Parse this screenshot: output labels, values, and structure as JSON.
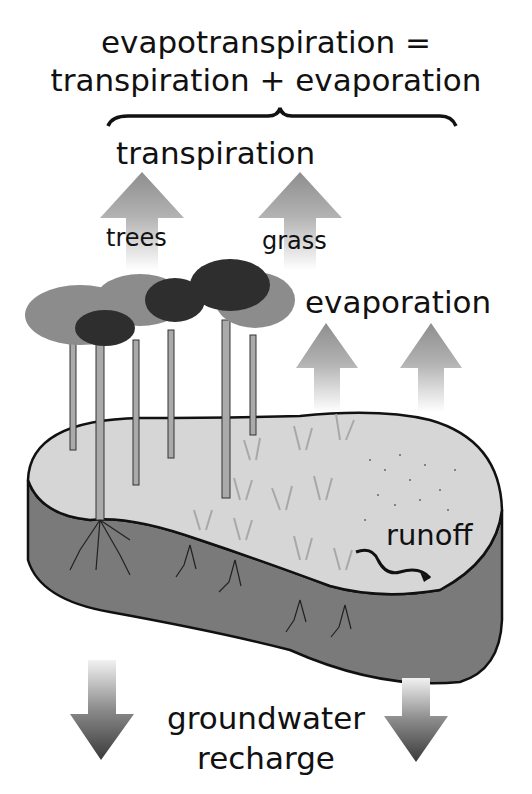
{
  "diagram": {
    "title_line1": "evapotranspiration =",
    "title_line2": "transpiration + evaporation",
    "labels": {
      "transpiration": "transpiration",
      "trees": "trees",
      "grass": "grass",
      "evaporation": "evaporation",
      "runoff": "runoff",
      "groundwater_line1": "groundwater",
      "groundwater_line2": "recharge"
    },
    "colors": {
      "background": "#ffffff",
      "soil_surface": "#d6d6d6",
      "soil_body": "#7a7a7a",
      "arrow_up": "#9a9a9a",
      "arrow_down": "#4a4a4a",
      "tree_canopy_light": "#8c8c8c",
      "tree_canopy_dark": "#2e2e2e",
      "grass": "#a8a8a8",
      "outline": "#111111"
    }
  }
}
